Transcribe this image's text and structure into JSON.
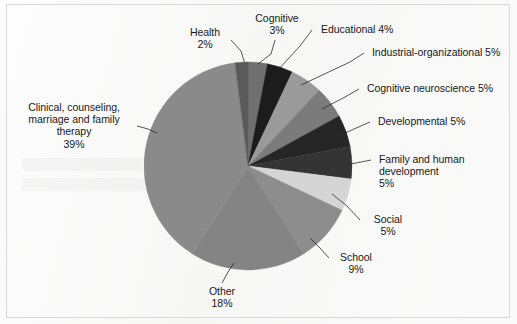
{
  "figure": {
    "background_color": "#fbfbfb",
    "frame_color": "#d8d8d8",
    "text_color": "#181818"
  },
  "chart_data": {
    "type": "pie",
    "title": "",
    "subtitle": "",
    "xlabel": "",
    "ylabel": "",
    "legend_position": "none",
    "grid": false,
    "units": "percent",
    "total": 100,
    "start_angle_deg": 0,
    "direction": "clockwise",
    "center": {
      "x": 248,
      "y": 166
    },
    "radius": 104,
    "categories": [
      "Cognitive",
      "Educational",
      "Industrial-organizational",
      "Cognitive neuroscience",
      "Developmental",
      "Family and human development",
      "Social",
      "School",
      "Other",
      "Clinical, counseling, marriage and family therapy",
      "Health"
    ],
    "values": [
      3,
      4,
      5,
      5,
      5,
      5,
      5,
      9,
      18,
      39,
      2
    ],
    "colors": [
      "#6f6f6f",
      "#1c1c1c",
      "#9a9a9a",
      "#7b7b7b",
      "#262626",
      "#343434",
      "#d5d5d5",
      "#8d8d8d",
      "#848484",
      "#8a8a8a",
      "#5a5a5a"
    ],
    "slices": [
      {
        "name": "Cognitive",
        "value": 3,
        "color": "#6f6f6f",
        "label_text": "Cognitive\n3%",
        "label_name": "Cognitive",
        "label_value": "3%"
      },
      {
        "name": "Educational",
        "value": 4,
        "color": "#1c1c1c",
        "label_text": "Educational 4%",
        "label_name": "Educational",
        "label_value": "4%"
      },
      {
        "name": "Industrial-organizational",
        "value": 5,
        "color": "#9a9a9a",
        "label_text": "Industrial-organizational 5%",
        "label_name": "Industrial-organizational",
        "label_value": "5%"
      },
      {
        "name": "Cognitive neuroscience",
        "value": 5,
        "color": "#7b7b7b",
        "label_text": "Cognitive neuroscience 5%",
        "label_name": "Cognitive neuroscience",
        "label_value": "5%"
      },
      {
        "name": "Developmental",
        "value": 5,
        "color": "#262626",
        "label_text": "Developmental 5%",
        "label_name": "Developmental",
        "label_value": "5%"
      },
      {
        "name": "Family and human development",
        "value": 5,
        "color": "#343434",
        "label_text": "Family and human\ndevelopment\n5%",
        "label_name": "Family and human development",
        "label_value": "5%"
      },
      {
        "name": "Social",
        "value": 5,
        "color": "#d5d5d5",
        "label_text": "Social\n5%",
        "label_name": "Social",
        "label_value": "5%"
      },
      {
        "name": "School",
        "value": 9,
        "color": "#8d8d8d",
        "label_text": "School\n9%",
        "label_name": "School",
        "label_value": "9%"
      },
      {
        "name": "Other",
        "value": 18,
        "color": "#848484",
        "label_text": "Other\n18%",
        "label_name": "Other",
        "label_value": "18%"
      },
      {
        "name": "Clinical, counseling, marriage and family therapy",
        "value": 39,
        "color": "#8a8a8a",
        "label_text": "Clinical, counseling,\nmarriage and family\ntherapy\n39%",
        "label_name": "Clinical, counseling, marriage and family therapy",
        "label_value": "39%"
      },
      {
        "name": "Health",
        "value": 2,
        "color": "#5a5a5a",
        "label_text": "Health\n2%",
        "label_name": "Health",
        "label_value": "2%"
      }
    ]
  },
  "labels": {
    "health": "Health\n2%",
    "cognitive": "Cognitive\n3%",
    "educational": "Educational 4%",
    "industrial_organizational": "Industrial-organizational 5%",
    "cognitive_neuroscience": "Cognitive neuroscience 5%",
    "developmental": "Developmental 5%",
    "family_and_human_development": "Family and human\ndevelopment\n5%",
    "social": "Social\n5%",
    "school": "School\n9%",
    "other": "Other\n18%",
    "clinical": "Clinical, counseling,\nmarriage and family\ntherapy\n39%"
  }
}
